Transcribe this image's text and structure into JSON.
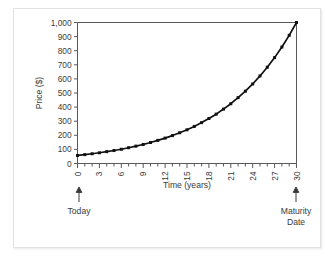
{
  "figure": {
    "background_color": "#ffffff",
    "card_color": "#ffffff",
    "card_border_color": "#e2e2e2",
    "curve_color": "#111111",
    "axis_color": "#58595b",
    "text_color": "#3b3b3b"
  },
  "chart_data": {
    "type": "line",
    "title": "",
    "xlabel": "Time (years)",
    "ylabel": "Price ($)",
    "xlim": [
      0,
      30
    ],
    "ylim": [
      0,
      1000
    ],
    "grid": false,
    "legend": "none",
    "x_tick_labels": [
      "0",
      "3",
      "6",
      "9",
      "12",
      "15",
      "18",
      "21",
      "24",
      "27",
      "30"
    ],
    "x_tick_values": [
      0,
      3,
      6,
      9,
      12,
      15,
      18,
      21,
      24,
      27,
      30
    ],
    "x_minor_tick_values": [
      0,
      1,
      2,
      3,
      4,
      5,
      6,
      7,
      8,
      9,
      10,
      11,
      12,
      13,
      14,
      15,
      16,
      17,
      18,
      19,
      20,
      21,
      22,
      23,
      24,
      25,
      26,
      27,
      28,
      29,
      30
    ],
    "x_tick_label_rotation": -90,
    "y_tick_labels": [
      "0",
      "100",
      "200",
      "300",
      "400",
      "500",
      "600",
      "700",
      "800",
      "900",
      "1,000"
    ],
    "y_tick_values": [
      0,
      100,
      200,
      300,
      400,
      500,
      600,
      700,
      800,
      900,
      1000
    ],
    "markers": "filled-square",
    "x": [
      0,
      1,
      2,
      3,
      4,
      5,
      6,
      7,
      8,
      9,
      10,
      11,
      12,
      13,
      14,
      15,
      16,
      17,
      18,
      19,
      20,
      21,
      22,
      23,
      24,
      25,
      26,
      27,
      28,
      29,
      30
    ],
    "values": [
      57,
      63,
      69,
      76,
      84,
      92,
      101,
      112,
      123,
      135,
      149,
      164,
      180,
      198,
      218,
      239,
      263,
      290,
      319,
      350,
      386,
      424,
      467,
      513,
      564,
      621,
      683,
      751,
      826,
      909,
      1000
    ],
    "annotations": [
      {
        "text": "Today",
        "at_x": 0,
        "marker": "up-arrow"
      },
      {
        "text": "Maturity Date",
        "text_line1": "Maturity",
        "text_line2": "Date",
        "at_x": 30,
        "marker": "up-arrow"
      }
    ]
  }
}
